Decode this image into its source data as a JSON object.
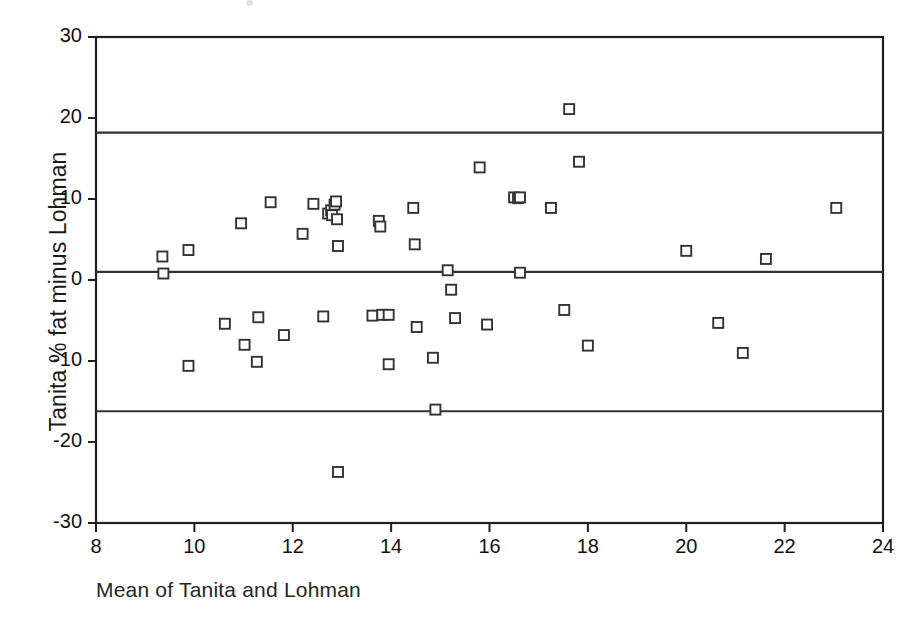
{
  "chart_data": {
    "type": "scatter",
    "title": "",
    "xlabel": "Mean of Tanita and Lohman",
    "ylabel": "Tanita % fat minus Lohman",
    "xlim": [
      8,
      24
    ],
    "ylim": [
      -30,
      30
    ],
    "xticks": [
      8,
      10,
      12,
      14,
      16,
      18,
      20,
      22,
      24
    ],
    "yticks": [
      30,
      20,
      10,
      0,
      -10,
      -20,
      -30
    ],
    "grid": false,
    "legend": null,
    "marker": "open-square",
    "marker_color": "#333333",
    "reference_lines": [
      {
        "name": "upper-limit-of-agreement",
        "value": 18.2
      },
      {
        "name": "mean-bias",
        "value": 1.0
      },
      {
        "name": "lower-limit-of-agreement",
        "value": -16.2
      }
    ],
    "points": [
      [
        9.35,
        2.9
      ],
      [
        9.37,
        0.8
      ],
      [
        9.88,
        3.7
      ],
      [
        9.88,
        -10.6
      ],
      [
        10.62,
        -5.4
      ],
      [
        10.95,
        7.0
      ],
      [
        11.02,
        -8.0
      ],
      [
        11.27,
        -10.1
      ],
      [
        11.3,
        -4.6
      ],
      [
        11.55,
        9.6
      ],
      [
        11.82,
        -6.8
      ],
      [
        12.2,
        5.7
      ],
      [
        12.42,
        9.4
      ],
      [
        12.62,
        -4.5
      ],
      [
        12.72,
        8.2
      ],
      [
        12.78,
        8.6
      ],
      [
        12.8,
        8.0
      ],
      [
        12.85,
        9.3
      ],
      [
        12.88,
        9.7
      ],
      [
        12.9,
        7.5
      ],
      [
        12.92,
        4.2
      ],
      [
        12.92,
        -23.7
      ],
      [
        13.62,
        -4.4
      ],
      [
        13.75,
        7.3
      ],
      [
        13.78,
        6.6
      ],
      [
        13.82,
        -4.3
      ],
      [
        13.95,
        -4.3
      ],
      [
        13.95,
        -10.4
      ],
      [
        14.45,
        8.9
      ],
      [
        14.48,
        4.4
      ],
      [
        14.52,
        -5.8
      ],
      [
        14.85,
        -9.6
      ],
      [
        14.9,
        -16.0
      ],
      [
        15.15,
        1.2
      ],
      [
        15.22,
        -1.2
      ],
      [
        15.3,
        -4.7
      ],
      [
        15.8,
        13.9
      ],
      [
        15.95,
        -5.5
      ],
      [
        16.5,
        10.2
      ],
      [
        16.58,
        10.1
      ],
      [
        16.62,
        10.2
      ],
      [
        16.62,
        0.9
      ],
      [
        17.25,
        8.9
      ],
      [
        17.52,
        -3.7
      ],
      [
        17.62,
        21.1
      ],
      [
        17.82,
        14.6
      ],
      [
        18.0,
        -8.1
      ],
      [
        20.0,
        3.6
      ],
      [
        20.65,
        -5.3
      ],
      [
        21.15,
        -9.0
      ],
      [
        21.62,
        2.6
      ],
      [
        23.05,
        8.9
      ]
    ]
  },
  "axes": {
    "frame_color": "#1f1f1f",
    "line_color": "#333333"
  }
}
